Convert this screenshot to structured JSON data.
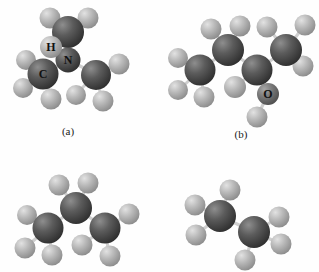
{
  "figure": {
    "kind": "molecular-models",
    "panel_count": 4,
    "background_color": "#ffffff"
  },
  "captions": {
    "a": "(a)",
    "b": "(b)"
  },
  "atom_colors": {
    "carbon": "#4f4f4f",
    "nitrogen": "#4a4a4a",
    "oxygen": "#6e6e6e",
    "hydrogen": "#b4b4b4",
    "bond": "#c8c8c8",
    "label_text": "#111111"
  },
  "panels": [
    {
      "id": "a",
      "name": "trimethylamine-model",
      "caption": "(a)",
      "labels": [
        {
          "symbol": "H",
          "element": "hydrogen"
        },
        {
          "symbol": "N",
          "element": "nitrogen"
        },
        {
          "symbol": "C",
          "element": "carbon"
        }
      ],
      "atom_counts": {
        "carbon": 3,
        "nitrogen": 1,
        "hydrogen": 9
      }
    },
    {
      "id": "b",
      "name": "alcohol-model",
      "caption": "(b)",
      "labels": [
        {
          "symbol": "O",
          "element": "oxygen"
        }
      ],
      "atom_counts": {
        "carbon": 4,
        "oxygen": 1,
        "hydrogen": 10
      }
    },
    {
      "id": "c",
      "name": "propane-model",
      "caption": "",
      "labels": [],
      "atom_counts": {
        "carbon": 3,
        "hydrogen": 8
      }
    },
    {
      "id": "d",
      "name": "ethane-model",
      "caption": "",
      "labels": [],
      "atom_counts": {
        "carbon": 2,
        "hydrogen": 6
      }
    }
  ],
  "atom_label_glyphs": {
    "h": "H",
    "n": "N",
    "c": "C",
    "o": "O"
  }
}
